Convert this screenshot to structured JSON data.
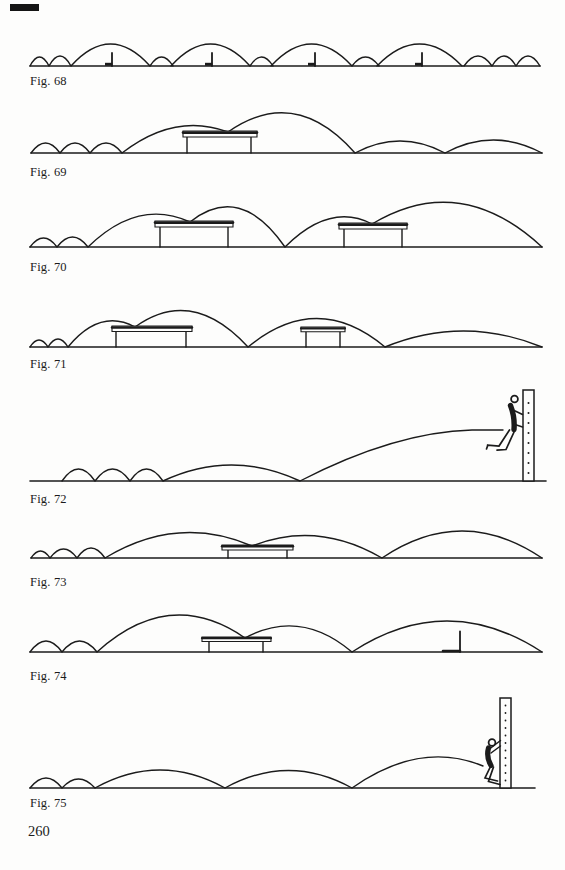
{
  "page": {
    "number": "260",
    "paper_color": "#fdfdfc",
    "ink_color": "#1b1b1b"
  },
  "figures": [
    {
      "label": "Fig. 68"
    },
    {
      "label": "Fig. 69"
    },
    {
      "label": "Fig. 70"
    },
    {
      "label": "Fig. 71"
    },
    {
      "label": "Fig. 72"
    },
    {
      "label": "Fig. 73"
    },
    {
      "label": "Fig. 74"
    },
    {
      "label": "Fig. 75"
    }
  ]
}
